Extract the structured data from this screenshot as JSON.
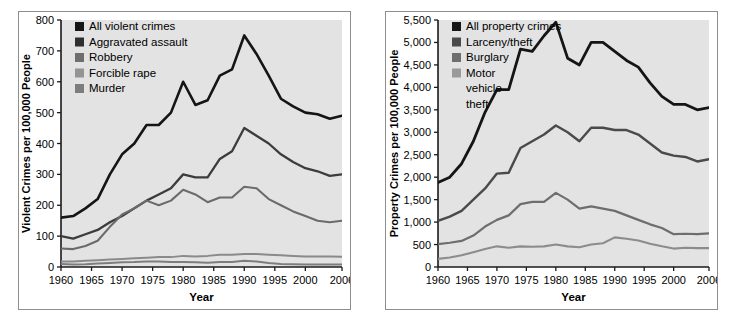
{
  "figure": {
    "background": "#ffffff",
    "panel_border": "#8e8e8e",
    "plot_background": "#e3e3e3",
    "axis_color": "#1a1a1a"
  },
  "chart_data": [
    {
      "type": "line",
      "id": "violent-crimes",
      "title": "",
      "xlabel": "Year",
      "ylabel": "Violent Crimes per 100,000 People",
      "xlim": [
        1960,
        2006
      ],
      "ylim": [
        0,
        800
      ],
      "yticks": [
        0,
        100,
        200,
        300,
        400,
        500,
        600,
        700,
        800
      ],
      "ytick_labels": [
        "0",
        "100",
        "200",
        "300",
        "400",
        "500",
        "600",
        "700",
        "800"
      ],
      "xticks": [
        1960,
        1965,
        1970,
        1975,
        1980,
        1985,
        1990,
        1995,
        2000,
        2006
      ],
      "xtick_labels": [
        "1960",
        "1965",
        "1970",
        "1975",
        "1980",
        "1985",
        "1990",
        "1995",
        "2000",
        "2006"
      ],
      "grid": false,
      "legend_position": "top-left",
      "x": [
        1960,
        1962,
        1964,
        1966,
        1968,
        1970,
        1972,
        1974,
        1976,
        1978,
        1980,
        1982,
        1984,
        1986,
        1988,
        1990,
        1992,
        1994,
        1996,
        1998,
        2000,
        2002,
        2004,
        2006
      ],
      "series": [
        {
          "name": "All violent crimes",
          "color": "#151515",
          "width": 2.6,
          "values": [
            160,
            165,
            190,
            220,
            300,
            365,
            400,
            460,
            460,
            500,
            600,
            525,
            540,
            620,
            640,
            750,
            690,
            620,
            545,
            520,
            500,
            495,
            480,
            490
          ]
        },
        {
          "name": "Aggravated assault",
          "color": "#3c3c3c",
          "width": 2.3,
          "values": [
            100,
            92,
            106,
            120,
            145,
            165,
            190,
            215,
            235,
            255,
            300,
            290,
            290,
            350,
            375,
            450,
            425,
            400,
            365,
            340,
            320,
            310,
            295,
            300
          ]
        },
        {
          "name": "Robbery",
          "color": "#6b6b6b",
          "width": 2.1,
          "values": [
            60,
            58,
            68,
            85,
            130,
            170,
            190,
            215,
            200,
            215,
            250,
            235,
            210,
            225,
            225,
            260,
            255,
            220,
            200,
            180,
            165,
            150,
            145,
            150
          ]
        },
        {
          "name": "Forcible rape",
          "color": "#8a8a8a",
          "width": 2.0,
          "values": [
            18,
            18,
            20,
            22,
            24,
            26,
            28,
            30,
            32,
            32,
            36,
            34,
            36,
            40,
            40,
            42,
            42,
            40,
            38,
            36,
            34,
            34,
            34,
            33
          ]
        },
        {
          "name": "Murder",
          "color": "#7d7d7d",
          "width": 2.0,
          "values": [
            10,
            8,
            9,
            11,
            13,
            15,
            16,
            18,
            18,
            16,
            16,
            15,
            14,
            16,
            16,
            20,
            18,
            13,
            10,
            9,
            8,
            8,
            8,
            8
          ]
        }
      ],
      "legend": [
        {
          "label": "All violent crimes",
          "swatch": "#151515"
        },
        {
          "label": "Aggravated assault",
          "swatch": "#2f2f2f"
        },
        {
          "label": "Robbery",
          "swatch": "#6e6e6e"
        },
        {
          "label": "Forcible rape",
          "swatch": "#949494"
        },
        {
          "label": "Murder",
          "swatch": "#7d7d7d"
        }
      ]
    },
    {
      "type": "line",
      "id": "property-crimes",
      "title": "",
      "xlabel": "Year",
      "ylabel": "Property Crimes per 100,000 People",
      "xlim": [
        1960,
        2006
      ],
      "ylim": [
        0,
        5500
      ],
      "yticks": [
        0,
        500,
        1000,
        1500,
        2000,
        2500,
        3000,
        3500,
        4000,
        4500,
        5000,
        5500
      ],
      "ytick_labels": [
        "0",
        "500",
        "1,000",
        "1,500",
        "2,000",
        "2,500",
        "3,000",
        "3,500",
        "4,000",
        "4,500",
        "5,000",
        "5,500"
      ],
      "xticks": [
        1960,
        1965,
        1970,
        1975,
        1980,
        1985,
        1990,
        1995,
        2000,
        2006
      ],
      "xtick_labels": [
        "1960",
        "1965",
        "1970",
        "1975",
        "1980",
        "1985",
        "1990",
        "1995",
        "2000",
        "2006"
      ],
      "grid": false,
      "legend_position": "top-left",
      "x": [
        1960,
        1962,
        1964,
        1966,
        1968,
        1970,
        1972,
        1974,
        1976,
        1978,
        1980,
        1982,
        1984,
        1986,
        1988,
        1990,
        1992,
        1994,
        1996,
        1998,
        2000,
        2002,
        2004,
        2006
      ],
      "series": [
        {
          "name": "All property crimes",
          "color": "#151515",
          "width": 2.8,
          "values": [
            1880,
            2000,
            2300,
            2800,
            3450,
            3950,
            3950,
            4850,
            4800,
            5150,
            5450,
            4650,
            4500,
            5000,
            5000,
            4800,
            4600,
            4450,
            4100,
            3800,
            3620,
            3620,
            3500,
            3550
          ]
        },
        {
          "name": "Larceny/theft",
          "color": "#4a4a4a",
          "width": 2.4,
          "values": [
            1030,
            1120,
            1250,
            1500,
            1750,
            2080,
            2100,
            2650,
            2800,
            2950,
            3150,
            3000,
            2800,
            3100,
            3100,
            3050,
            3050,
            2950,
            2750,
            2550,
            2480,
            2450,
            2350,
            2400
          ]
        },
        {
          "name": "Burglary",
          "color": "#6e6e6e",
          "width": 2.2,
          "values": [
            510,
            540,
            580,
            700,
            900,
            1050,
            1150,
            1400,
            1450,
            1450,
            1650,
            1500,
            1300,
            1350,
            1300,
            1250,
            1150,
            1050,
            950,
            870,
            730,
            740,
            730,
            750
          ]
        },
        {
          "name": "Motor vehicle theft",
          "color": "#8c8c8c",
          "width": 2.1,
          "values": [
            180,
            210,
            260,
            330,
            400,
            460,
            430,
            460,
            450,
            460,
            500,
            460,
            440,
            500,
            530,
            660,
            630,
            590,
            520,
            460,
            410,
            430,
            420,
            420
          ]
        }
      ],
      "legend": [
        {
          "label": "All property crimes",
          "swatch": "#151515"
        },
        {
          "label": "Larceny/theft",
          "swatch": "#4a4a4a"
        },
        {
          "label": "Burglary",
          "swatch": "#6e6e6e"
        },
        {
          "label": "Motor vehicle theft",
          "swatch": "#9a9a9a"
        }
      ]
    }
  ]
}
